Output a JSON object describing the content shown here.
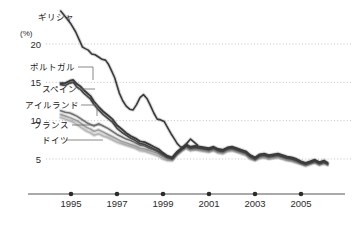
{
  "chart_data": {
    "type": "line",
    "title": "",
    "subtitle": "",
    "xlabel": "",
    "ylabel": "",
    "yunit": "(%)",
    "grid": true,
    "legend_position": "inline-left-labels",
    "xlim": [
      1994.0,
      2006.3
    ],
    "ylim": [
      3.0,
      25.0
    ],
    "yticks": [
      20,
      15,
      10,
      5
    ],
    "ytick_labels": [
      "20",
      "15",
      "10",
      "5"
    ],
    "xticks": [
      1995,
      1997,
      1999,
      2001,
      2003,
      2005
    ],
    "xtick_labels": [
      "1995",
      "1997",
      "1999",
      "2001",
      "2003",
      "2005"
    ],
    "series": [
      {
        "name": "ギリシャ",
        "color": "#3a3a3a",
        "width": 1.6,
        "x": [
          1994.55,
          1994.8,
          1995.0,
          1995.2,
          1995.35,
          1995.5,
          1995.62,
          1995.75,
          1995.9,
          1996.05,
          1996.2,
          1996.35,
          1996.5,
          1996.62,
          1996.75,
          1996.9,
          1997.0,
          1997.1,
          1997.25,
          1997.4,
          1997.55,
          1997.7,
          1997.85,
          1998.0,
          1998.15,
          1998.3,
          1998.45,
          1998.6,
          1998.75,
          1998.9,
          1999.05,
          1999.2,
          1999.35,
          1999.5,
          1999.62,
          1999.75,
          1999.9,
          2000.05,
          2000.2,
          2000.35,
          2000.5
        ],
        "values": [
          24.3,
          23.4,
          22.6,
          21.6,
          20.6,
          19.6,
          19.4,
          19.2,
          18.7,
          18.6,
          18.3,
          18.0,
          17.9,
          17.4,
          16.6,
          15.6,
          14.6,
          13.6,
          12.6,
          11.9,
          11.5,
          11.4,
          12.1,
          13.0,
          13.4,
          12.9,
          12.0,
          11.0,
          10.2,
          10.1,
          9.9,
          9.1,
          8.3,
          7.6,
          7.0,
          6.6,
          6.5,
          7.1,
          7.6,
          7.2,
          6.8
        ]
      },
      {
        "name": "ポルトガル",
        "color": "#3a3a3a",
        "width": 1.9,
        "x": [
          1994.55,
          1994.75,
          1994.95,
          1995.1,
          1995.25,
          1995.4,
          1995.55,
          1995.7,
          1995.85,
          1996.0,
          1996.2,
          1996.4,
          1996.6,
          1996.8,
          1997.0,
          1997.2,
          1997.4,
          1997.6,
          1997.8,
          1998.0,
          1998.2,
          1998.4,
          1998.6,
          1998.8,
          1999.0,
          1999.2,
          1999.4,
          1999.6,
          1999.8,
          2000.0,
          2000.2,
          2000.4,
          2000.6,
          2000.8,
          2001.0,
          2001.2,
          2001.4,
          2001.6,
          2001.8,
          2002.0,
          2002.2,
          2002.4,
          2002.6,
          2002.8,
          2003.0,
          2003.2,
          2003.4,
          2003.6,
          2003.8,
          2004.0,
          2004.2,
          2004.4,
          2004.6,
          2004.8,
          2005.0,
          2005.2,
          2005.4,
          2005.6,
          2005.8,
          2006.0,
          2006.15
        ],
        "values": [
          14.9,
          14.9,
          15.2,
          15.3,
          14.8,
          14.5,
          14.0,
          13.6,
          13.2,
          12.5,
          11.8,
          11.2,
          10.7,
          10.2,
          9.4,
          8.9,
          8.4,
          8.0,
          7.7,
          7.3,
          7.2,
          6.9,
          6.6,
          6.3,
          5.8,
          5.4,
          5.2,
          5.9,
          6.4,
          6.9,
          6.6,
          6.7,
          6.6,
          6.5,
          6.4,
          6.6,
          6.3,
          6.2,
          6.5,
          6.6,
          6.4,
          6.2,
          6.0,
          5.5,
          5.2,
          5.6,
          5.7,
          5.5,
          5.6,
          5.7,
          5.5,
          5.3,
          5.2,
          5.0,
          4.7,
          4.5,
          4.7,
          4.9,
          4.6,
          4.8,
          4.5
        ]
      },
      {
        "name": "スペイン",
        "color": "#4a4a4a",
        "width": 1.7,
        "x": [
          1994.55,
          1994.75,
          1994.95,
          1995.1,
          1995.25,
          1995.4,
          1995.55,
          1995.7,
          1995.85,
          1996.0,
          1996.2,
          1996.4,
          1996.6,
          1996.8,
          1997.0,
          1997.2,
          1997.4,
          1997.6,
          1997.8,
          1998.0,
          1998.2,
          1998.4,
          1998.6,
          1998.8,
          1999.0,
          1999.2,
          1999.4,
          1999.6,
          1999.8,
          2000.0,
          2000.2,
          2000.4,
          2000.6,
          2000.8,
          2001.0,
          2001.2,
          2001.4,
          2001.6,
          2001.8,
          2002.0,
          2002.2,
          2002.4,
          2002.6,
          2002.8,
          2003.0,
          2003.2,
          2003.4,
          2003.6,
          2003.8,
          2004.0,
          2004.2,
          2004.4,
          2004.6,
          2004.8,
          2005.0,
          2005.2,
          2005.4,
          2005.6,
          2005.8,
          2006.0,
          2006.15
        ],
        "values": [
          14.7,
          14.6,
          14.9,
          15.0,
          14.4,
          14.1,
          13.6,
          13.2,
          12.8,
          12.1,
          11.4,
          10.8,
          10.3,
          9.8,
          9.0,
          8.5,
          8.1,
          7.7,
          7.4,
          7.0,
          6.9,
          6.6,
          6.3,
          6.0,
          5.6,
          5.2,
          5.0,
          5.7,
          6.2,
          6.7,
          6.4,
          6.5,
          6.4,
          6.3,
          6.2,
          6.4,
          6.1,
          6.0,
          6.3,
          6.4,
          6.2,
          6.0,
          5.8,
          5.3,
          5.0,
          5.4,
          5.5,
          5.3,
          5.4,
          5.5,
          5.3,
          5.1,
          5.0,
          4.8,
          4.5,
          4.3,
          4.5,
          4.7,
          4.4,
          4.6,
          4.4
        ]
      },
      {
        "name": "アイルランド",
        "color": "#6f6f6f",
        "width": 1.5,
        "x": [
          1994.55,
          1994.75,
          1994.95,
          1995.1,
          1995.25,
          1995.4,
          1995.55,
          1995.7,
          1995.85,
          1996.0,
          1996.2,
          1996.4,
          1996.6,
          1996.8,
          1997.0,
          1997.2,
          1997.4,
          1997.6,
          1997.8,
          1998.0,
          1998.2,
          1998.4,
          1998.6,
          1998.8,
          1999.0,
          1999.2,
          1999.4,
          1999.6,
          1999.8,
          2000.0,
          2000.2,
          2000.4,
          2000.6,
          2000.8,
          2001.0,
          2001.2,
          2001.4,
          2001.6,
          2001.8,
          2002.0,
          2002.2,
          2002.4,
          2002.6,
          2002.8,
          2003.0,
          2003.2,
          2003.4,
          2003.6,
          2003.8,
          2004.0,
          2004.2,
          2004.4,
          2004.6,
          2004.8,
          2005.0,
          2005.2,
          2005.4,
          2005.6,
          2005.8,
          2006.0,
          2006.15
        ],
        "values": [
          11.3,
          11.1,
          11.0,
          10.8,
          10.6,
          10.3,
          10.0,
          9.7,
          9.5,
          9.3,
          9.6,
          9.3,
          9.0,
          8.6,
          8.2,
          7.9,
          7.6,
          7.4,
          7.1,
          6.8,
          6.7,
          6.4,
          6.2,
          5.9,
          5.5,
          5.2,
          5.1,
          5.8,
          6.3,
          6.7,
          6.4,
          6.5,
          6.4,
          6.3,
          6.2,
          6.4,
          6.1,
          6.0,
          6.3,
          6.4,
          6.2,
          6.0,
          5.8,
          5.3,
          5.0,
          5.4,
          5.5,
          5.3,
          5.4,
          5.5,
          5.3,
          5.1,
          5.0,
          4.8,
          4.5,
          4.3,
          4.5,
          4.7,
          4.4,
          4.6,
          4.4
        ]
      },
      {
        "name": "フランス",
        "color": "#9a9a9a",
        "width": 1.5,
        "x": [
          1994.55,
          1994.75,
          1994.95,
          1995.1,
          1995.25,
          1995.4,
          1995.55,
          1995.7,
          1995.85,
          1996.0,
          1996.2,
          1996.4,
          1996.6,
          1996.8,
          1997.0,
          1997.2,
          1997.4,
          1997.6,
          1997.8,
          1998.0,
          1998.2,
          1998.4,
          1998.6,
          1998.8,
          1999.0,
          1999.2,
          1999.4,
          1999.6,
          1999.8,
          2000.0,
          2000.2,
          2000.4,
          2000.6,
          2000.8,
          2001.0,
          2001.2,
          2001.4,
          2001.6,
          2001.8,
          2002.0,
          2002.2,
          2002.4,
          2002.6,
          2002.8,
          2003.0,
          2003.2,
          2003.4,
          2003.6,
          2003.8,
          2004.0,
          2004.2,
          2004.4,
          2004.6,
          2004.8,
          2005.0,
          2005.2,
          2005.4,
          2005.6,
          2005.8,
          2006.0,
          2006.15
        ],
        "values": [
          10.8,
          10.6,
          10.4,
          10.2,
          10.0,
          9.7,
          9.4,
          9.1,
          8.9,
          8.6,
          8.8,
          8.5,
          8.2,
          7.9,
          7.6,
          7.3,
          7.1,
          6.9,
          6.7,
          6.4,
          6.3,
          6.1,
          5.9,
          5.7,
          5.3,
          5.0,
          4.9,
          5.6,
          6.1,
          6.5,
          6.2,
          6.3,
          6.2,
          6.1,
          6.0,
          6.2,
          5.9,
          5.8,
          6.1,
          6.2,
          6.0,
          5.8,
          5.6,
          5.1,
          4.9,
          5.2,
          5.3,
          5.1,
          5.2,
          5.3,
          5.1,
          4.9,
          4.8,
          4.6,
          4.4,
          4.2,
          4.4,
          4.6,
          4.3,
          4.5,
          4.3
        ]
      },
      {
        "name": "ドイツ",
        "color": "#b4b4b4",
        "width": 1.5,
        "x": [
          1994.55,
          1994.75,
          1994.95,
          1995.1,
          1995.25,
          1995.4,
          1995.55,
          1995.7,
          1995.85,
          1996.0,
          1996.2,
          1996.4,
          1996.6,
          1996.8,
          1997.0,
          1997.2,
          1997.4,
          1997.6,
          1997.8,
          1998.0,
          1998.2,
          1998.4,
          1998.6,
          1998.8,
          1999.0,
          1999.2,
          1999.4,
          1999.6,
          1999.8,
          2000.0,
          2000.2,
          2000.4,
          2000.6,
          2000.8,
          2001.0,
          2001.2,
          2001.4,
          2001.6,
          2001.8,
          2002.0,
          2002.2,
          2002.4,
          2002.6,
          2002.8,
          2003.0,
          2003.2,
          2003.4,
          2003.6,
          2003.8,
          2004.0,
          2004.2,
          2004.4,
          2004.6,
          2004.8,
          2005.0,
          2005.2,
          2005.4,
          2005.6,
          2005.8,
          2006.0,
          2006.15
        ],
        "values": [
          10.4,
          10.2,
          10.0,
          9.8,
          9.5,
          9.2,
          8.9,
          8.6,
          8.4,
          8.1,
          8.3,
          8.0,
          7.8,
          7.5,
          7.2,
          7.0,
          6.8,
          6.6,
          6.4,
          6.1,
          6.0,
          5.8,
          5.6,
          5.4,
          5.0,
          4.8,
          4.8,
          5.5,
          6.0,
          6.4,
          6.1,
          6.2,
          6.1,
          6.0,
          5.9,
          6.1,
          5.8,
          5.7,
          6.0,
          6.1,
          5.9,
          5.7,
          5.5,
          5.0,
          4.8,
          5.1,
          5.2,
          5.0,
          5.1,
          5.2,
          5.0,
          4.8,
          4.7,
          4.5,
          4.3,
          4.1,
          4.3,
          4.5,
          4.2,
          4.4,
          4.2
        ]
      }
    ],
    "annotations": [
      {
        "name": "ギリシャ",
        "label_x": 38,
        "label_y": 20,
        "leader": "none"
      },
      {
        "name": "ポルトガル",
        "label_x": 30,
        "label_y": 70,
        "leader": "hook-down"
      },
      {
        "name": "スペイン",
        "label_x": 42,
        "label_y": 92,
        "leader": "straight"
      },
      {
        "name": "アイルランド",
        "label_x": 25,
        "label_y": 108,
        "leader": "hook-down"
      },
      {
        "name": "フランス",
        "label_x": 33,
        "label_y": 128,
        "leader": "straight"
      },
      {
        "name": "ドイツ",
        "label_x": 42,
        "label_y": 143,
        "leader": "straight"
      }
    ]
  },
  "axis": {
    "unit": "(%)",
    "y_labels": [
      "20",
      "15",
      "10",
      "5"
    ],
    "x_labels": [
      "1995",
      "1997",
      "1999",
      "2001",
      "2003",
      "2005"
    ]
  },
  "series_labels": {
    "greece": "ギリシャ",
    "portugal": "ポルトガル",
    "spain": "スペイン",
    "ireland": "アイルランド",
    "france": "フランス",
    "germany": "ドイツ"
  },
  "colors": {
    "grid": "#b8b8b8",
    "axis": "#555555",
    "text": "#2b2b2b",
    "background": "#ffffff"
  }
}
